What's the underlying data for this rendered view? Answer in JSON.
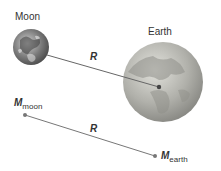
{
  "labels": {
    "moon": "Moon",
    "earth": "Earth",
    "r_top": "R",
    "r_bottom": "R",
    "m_moon_symbol": "M",
    "m_moon_sub": "moon",
    "m_earth_symbol": "M",
    "m_earth_sub": "earth"
  },
  "colors": {
    "line": "#666666",
    "moon": "#8a8a8a",
    "earth": "#b5b5b0",
    "dot": "#555555"
  }
}
